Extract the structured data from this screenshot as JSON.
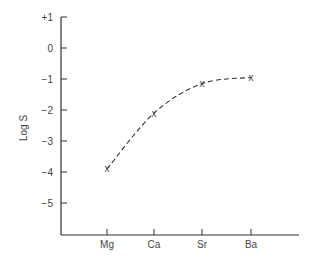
{
  "chart_data": {
    "type": "line",
    "title": "",
    "xlabel": "",
    "ylabel": "Log S",
    "categories": [
      "Mg",
      "Ca",
      "Sr",
      "Ba"
    ],
    "series": [
      {
        "name": "Log S",
        "values": [
          -3.9,
          -2.1,
          -1.15,
          -0.95
        ],
        "marker": "x",
        "line_style": "dashed"
      }
    ],
    "y_ticks": [
      "+1",
      "0",
      "−1",
      "−2",
      "−3",
      "−4",
      "−5"
    ],
    "y_tick_values": [
      1,
      0,
      -1,
      -2,
      -3,
      -4,
      -5
    ],
    "ylim": [
      -6,
      1
    ],
    "grid": false,
    "legend": "none"
  },
  "colors": {
    "ink": "#333333",
    "background": "#ffffff"
  }
}
